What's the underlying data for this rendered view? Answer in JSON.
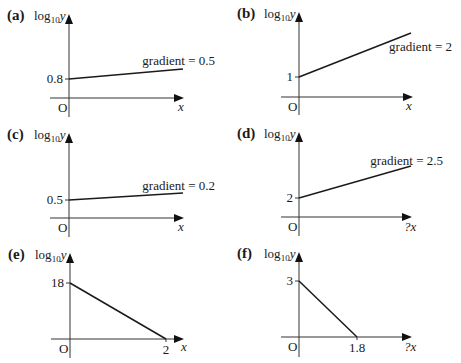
{
  "figure": {
    "y_axis_title": {
      "prefix": "log",
      "subscript": "10",
      "var": "y"
    },
    "origin_label": "O",
    "panels": [
      {
        "id": "a",
        "label": "(a)",
        "origin": [
          69,
          98
        ],
        "y_top": 14,
        "y_bottom": 117,
        "x_left": 50,
        "x_tip": 184,
        "line": [
          [
            69,
            79
          ],
          [
            183,
            69
          ]
        ],
        "y_intercept": {
          "label": "0.8",
          "y": 79
        },
        "x_intercept": null,
        "gradient_label": {
          "text": "gradient = 0.5",
          "x": 215,
          "y": 65
        },
        "x_label": {
          "text": "x",
          "x": 178,
          "y": 111
        }
      },
      {
        "id": "b",
        "label": "(b)",
        "origin": [
          299,
          97
        ],
        "y_top": 12,
        "y_bottom": 115,
        "x_left": 281,
        "x_tip": 413,
        "line": [
          [
            299,
            77
          ],
          [
            411,
            33
          ]
        ],
        "y_intercept": {
          "label": "1",
          "y": 77
        },
        "x_intercept": null,
        "gradient_label": {
          "text": "gradient = 2",
          "x": 452,
          "y": 51
        },
        "x_label": {
          "text": "x",
          "x": 406,
          "y": 110
        }
      },
      {
        "id": "c",
        "label": "(c)",
        "origin": [
          69,
          218
        ],
        "y_top": 133,
        "y_bottom": 237,
        "x_left": 50,
        "x_tip": 184,
        "line": [
          [
            69,
            200
          ],
          [
            183,
            193
          ]
        ],
        "y_intercept": {
          "label": "0.5",
          "y": 200
        },
        "x_intercept": null,
        "gradient_label": {
          "text": "gradient = 0.2",
          "x": 215,
          "y": 190
        },
        "x_label": {
          "text": "x",
          "x": 178,
          "y": 231
        }
      },
      {
        "id": "d",
        "label": "(d)",
        "origin": [
          299,
          217
        ],
        "y_top": 132,
        "y_bottom": 236,
        "x_left": 281,
        "x_tip": 412,
        "line": [
          [
            299,
            198
          ],
          [
            411,
            166
          ]
        ],
        "y_intercept": {
          "label": "2",
          "y": 198
        },
        "x_intercept": null,
        "gradient_label": {
          "text": "gradient = 2.5",
          "x": 443,
          "y": 165
        },
        "x_label": {
          "text": "?x",
          "x": 404,
          "y": 231
        }
      },
      {
        "id": "e",
        "label": "(e)",
        "origin": [
          70,
          339
        ],
        "y_top": 253,
        "y_bottom": 358,
        "x_left": 51,
        "x_tip": 184,
        "line": [
          [
            70,
            283
          ],
          [
            166,
            339
          ]
        ],
        "y_intercept": {
          "label": "18",
          "y": 283
        },
        "x_intercept": {
          "label": "2",
          "x": 166
        },
        "gradient_label": null,
        "x_label": {
          "text": "x",
          "x": 181,
          "y": 351
        }
      },
      {
        "id": "f",
        "label": "(f)",
        "origin": [
          299,
          337
        ],
        "y_top": 252,
        "y_bottom": 357,
        "x_left": 281,
        "x_tip": 412,
        "line": [
          [
            299,
            281
          ],
          [
            357,
            337
          ]
        ],
        "y_intercept": {
          "label": "3",
          "y": 281
        },
        "x_intercept": {
          "label": "1.8",
          "x": 357
        },
        "gradient_label": null,
        "x_label": {
          "text": "?x",
          "x": 404,
          "y": 351
        }
      }
    ]
  },
  "chart_data": {
    "type": "line",
    "title": "",
    "xlabel": "x",
    "ylabel": "log10 y",
    "series": [
      {
        "name": "(a)",
        "y_intercept": 0.8,
        "gradient": 0.5
      },
      {
        "name": "(b)",
        "y_intercept": 1,
        "gradient": 2
      },
      {
        "name": "(c)",
        "y_intercept": 0.5,
        "gradient": 0.2
      },
      {
        "name": "(d)",
        "y_intercept": 2,
        "gradient": 2.5
      },
      {
        "name": "(e)",
        "y_intercept": 18,
        "x_intercept": 2
      },
      {
        "name": "(f)",
        "y_intercept": 3,
        "x_intercept": 1.8
      }
    ]
  }
}
